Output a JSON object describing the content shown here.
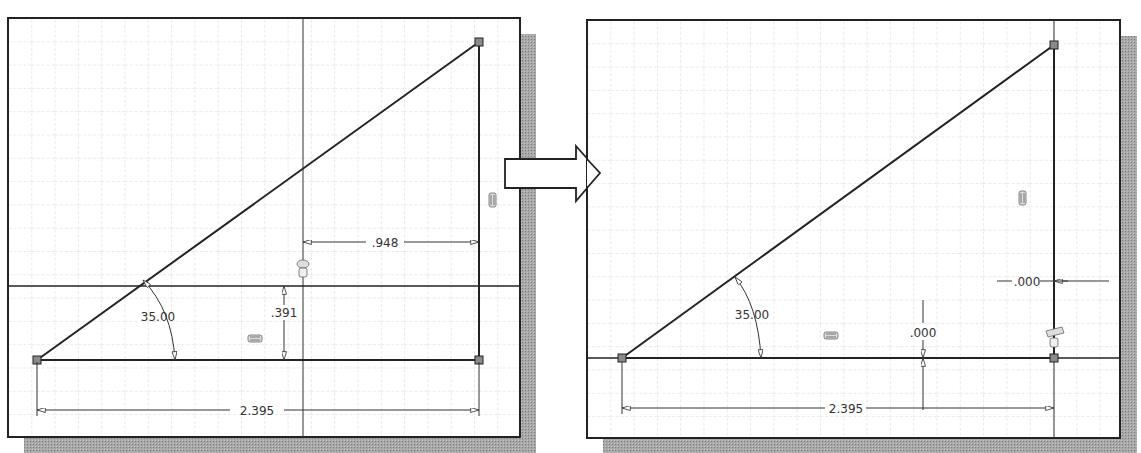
{
  "colors": {
    "background": "#ffffff",
    "frame": "#222222",
    "grid": "#c9c9c9",
    "geometry": "#222222",
    "dimension": "#333333",
    "vertex_fill": "#8a8a8a",
    "shadow": "#9a9a9a"
  },
  "left_panel": {
    "label": "before",
    "dimensions": {
      "angle": "35.00",
      "offset_horizontal": ".948",
      "offset_vertical": ".391",
      "base_length": "2.395"
    },
    "constraint_icons": [
      "horizontal-constraint-icon",
      "vertical-constraint-icon",
      "coincident-constraint-icon"
    ]
  },
  "transition_arrow": {
    "direction": "right",
    "icon": "right-arrow-icon"
  },
  "right_panel": {
    "label": "after",
    "dimensions": {
      "angle": "35.00",
      "offset_horizontal": ".000",
      "offset_vertical": ".000",
      "base_length": "2.395"
    },
    "constraint_icons": [
      "horizontal-constraint-icon",
      "vertical-constraint-icon",
      "coincident-constraint-icon"
    ]
  }
}
